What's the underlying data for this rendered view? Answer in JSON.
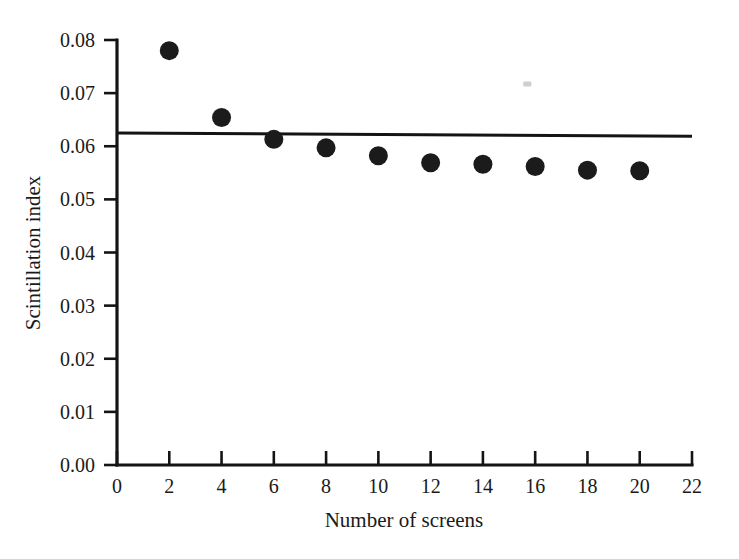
{
  "chart_data": {
    "type": "scatter",
    "title": "",
    "xlabel": "Number of screens",
    "ylabel": "Scintillation index",
    "xlim": [
      0,
      22
    ],
    "ylim": [
      0.0,
      0.08
    ],
    "grid": false,
    "legend": "none",
    "x_ticks": [
      "0",
      "2",
      "4",
      "6",
      "8",
      "10",
      "12",
      "14",
      "16",
      "18",
      "20",
      "22"
    ],
    "x_tick_values": [
      0,
      2,
      4,
      6,
      8,
      10,
      12,
      14,
      16,
      18,
      20,
      22
    ],
    "y_ticks": [
      "0.00",
      "0.01",
      "0.02",
      "0.03",
      "0.04",
      "0.05",
      "0.06",
      "0.07",
      "0.08"
    ],
    "y_tick_values": [
      0.0,
      0.01,
      0.02,
      0.03,
      0.04,
      0.05,
      0.06,
      0.07,
      0.08
    ],
    "series": [
      {
        "name": "Scintillation index vs number of screens",
        "marker": "filled-circle",
        "color": "#1b1b1b",
        "x": [
          2,
          4,
          6,
          8,
          10,
          12,
          14,
          16,
          18,
          20
        ],
        "values": [
          0.078,
          0.0654,
          0.0613,
          0.0597,
          0.0582,
          0.0569,
          0.0566,
          0.0562,
          0.0555,
          0.0554
        ]
      }
    ],
    "reference_line": {
      "name": "asymptotic value",
      "color": "#141414",
      "x": [
        0,
        22
      ],
      "values": [
        0.0625,
        0.0619
      ]
    },
    "annotations": [
      {
        "name": "scan-speck",
        "x": 15.7,
        "y": 0.0717
      }
    ]
  },
  "axes": {
    "x_axis_name": "x-axis",
    "y_axis_name": "y-axis"
  }
}
